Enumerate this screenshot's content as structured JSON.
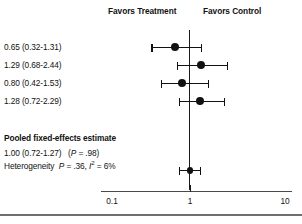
{
  "header": {
    "favors_left": "Favors Treatment",
    "favors_right": "Favors Control"
  },
  "pooled": {
    "title": "Pooled fixed-effects estimate",
    "estimate_text": "1.00 (0.72-1.27)  (P = .98)",
    "heterogeneity_text": "Heterogeneity P = .36, I2 = 6%",
    "estimate_label": "1.00 (0.72-1.27)",
    "p_label": "(P = .98)",
    "het_prefix": "Heterogeneity",
    "het_p": "= .36,",
    "het_i": "I",
    "het_i_sup": "2",
    "het_i_value": "= 6%"
  },
  "axis": {
    "ticks": [
      "0.1",
      "1",
      "10"
    ],
    "tick_values": [
      0.1,
      1,
      10
    ],
    "scale": "log"
  },
  "chart_data": {
    "type": "forest",
    "title": "",
    "xlabel": "",
    "ylabel": "",
    "xscale": "log",
    "xlim": [
      0.08,
      13
    ],
    "null_value": 1,
    "grid": false,
    "left_header": "Favors Treatment",
    "right_header": "Favors Control",
    "tick_labels": [
      "0.1",
      "1",
      "10"
    ],
    "tick_values": [
      0.1,
      1,
      10
    ],
    "studies": [
      {
        "label": "0.65 (0.32-1.31)",
        "estimate": 0.65,
        "lower": 0.32,
        "upper": 1.31
      },
      {
        "label": "1.29 (0.68-2.44)",
        "estimate": 1.29,
        "lower": 0.68,
        "upper": 2.44
      },
      {
        "label": "0.80 (0.42-1.53)",
        "estimate": 0.8,
        "lower": 0.42,
        "upper": 1.53
      },
      {
        "label": "1.28 (0.72-2.29)",
        "estimate": 1.28,
        "lower": 0.72,
        "upper": 2.29
      }
    ],
    "pooled": {
      "label": "Pooled fixed-effects estimate",
      "estimate": 1.0,
      "lower": 0.72,
      "upper": 1.27,
      "p_value": ".98",
      "heterogeneity_p": ".36",
      "i_squared": "6%"
    }
  }
}
